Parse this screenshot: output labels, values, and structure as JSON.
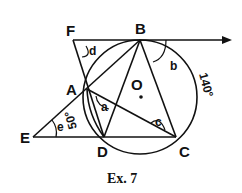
{
  "figure": {
    "points": {
      "A": "A",
      "B": "B",
      "C": "C",
      "D": "D",
      "E": "E",
      "F": "F",
      "O": "O"
    },
    "angles": {
      "a": "a",
      "b": "b",
      "c": "c",
      "d": "d",
      "e": "e"
    },
    "measures": {
      "arc_BC": "140°",
      "arc_AD": "50°"
    },
    "caption": "Ex. 7"
  }
}
